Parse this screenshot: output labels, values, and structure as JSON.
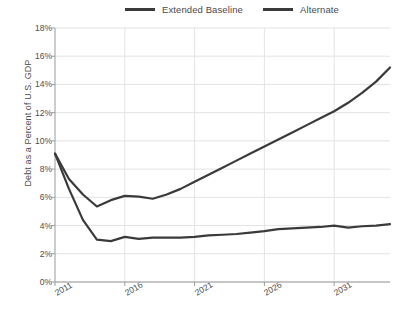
{
  "legend": {
    "items": [
      {
        "label": "Extended Baseline",
        "color": "#3a3a3a"
      },
      {
        "label": "Alternate",
        "color": "#3a3a3a"
      }
    ]
  },
  "axes": {
    "ylabel": "Debt as a Percent of U.S. GDP",
    "yticks": [
      "0%",
      "2%",
      "4%",
      "6%",
      "8%",
      "10%",
      "12%",
      "14%",
      "16%",
      "18%"
    ],
    "xticks": [
      "2011",
      "2016",
      "2021",
      "2026",
      "2031"
    ]
  },
  "chart_data": {
    "type": "line",
    "title": "",
    "xlabel": "",
    "ylabel": "Debt as a Percent of U.S. GDP",
    "xlim": [
      2011,
      2035
    ],
    "ylim": [
      0,
      18
    ],
    "ytick_values": [
      0,
      2,
      4,
      6,
      8,
      10,
      12,
      14,
      16,
      18
    ],
    "xtick_values": [
      2011,
      2016,
      2021,
      2026,
      2031
    ],
    "grid": true,
    "legend_position": "top",
    "x": [
      2011,
      2012,
      2013,
      2014,
      2015,
      2016,
      2017,
      2018,
      2019,
      2020,
      2021,
      2022,
      2023,
      2024,
      2025,
      2026,
      2027,
      2028,
      2029,
      2030,
      2031,
      2032,
      2033,
      2034,
      2035
    ],
    "series": [
      {
        "name": "Extended Baseline",
        "color": "#3a3a3a",
        "values": [
          9.1,
          7.3,
          6.2,
          5.35,
          5.8,
          6.1,
          6.05,
          5.9,
          6.2,
          6.6,
          7.1,
          7.6,
          8.1,
          8.6,
          9.1,
          9.6,
          10.1,
          10.6,
          11.1,
          11.6,
          12.1,
          12.7,
          13.4,
          14.2,
          15.2
        ]
      },
      {
        "name": "Alternate",
        "color": "#3a3a3a",
        "values": [
          9.1,
          6.6,
          4.4,
          3.0,
          2.9,
          3.2,
          3.05,
          3.15,
          3.15,
          3.15,
          3.2,
          3.3,
          3.35,
          3.4,
          3.5,
          3.6,
          3.75,
          3.8,
          3.85,
          3.9,
          4.0,
          3.85,
          3.95,
          4.0,
          4.1
        ]
      }
    ]
  }
}
